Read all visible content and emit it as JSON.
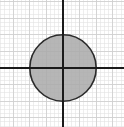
{
  "figure": {
    "title": "",
    "caption": "",
    "background_color": "#ffffff"
  },
  "chart_data": {
    "type": "scatter",
    "title": "",
    "subtitle": "",
    "xlabel": "",
    "ylabel": "",
    "xlim": [
      -6.5,
      6.2
    ],
    "ylim": [
      -6.2,
      7.3
    ],
    "grid": true,
    "legend": null,
    "annotations": [],
    "tick_labels": {
      "x": [],
      "y": []
    },
    "shapes": [
      {
        "kind": "circle",
        "label": "shaded-disk",
        "center_x": 0,
        "center_y": 0,
        "radius": 2,
        "fill_color": "#a9a9a9",
        "fill_opacity": 0.85,
        "stroke_color": "#2b2b2b",
        "stroke_width": 1.6,
        "filled": true
      }
    ],
    "axes": {
      "x_axis": {
        "color": "#1a1a1a",
        "width": 1.8,
        "arrow_start": false,
        "arrow_end": true,
        "start_x": -6.5,
        "end_x": 6.2,
        "y": 0
      },
      "y_axis": {
        "color": "#1a1a1a",
        "width": 1.8,
        "arrow_start": false,
        "arrow_end": true,
        "start_y": -6.2,
        "end_y": 7.3,
        "x": 0
      }
    },
    "grid_spec": {
      "minor_color": "#e2e2e2",
      "major_color": "#cfcfcf",
      "minor_step": 0.25,
      "major_step": 1,
      "x_min": -6.5,
      "x_max": 6.2,
      "y_min": -6.2,
      "y_max": 7.3
    }
  }
}
